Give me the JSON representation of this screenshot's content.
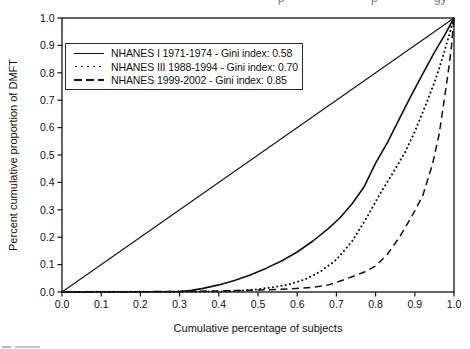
{
  "figure": {
    "background": "#ffffff",
    "ink": "#111111"
  },
  "artifacts": {
    "top_edge_descenders": [
      "p",
      "p",
      "gy"
    ]
  },
  "chart_data": {
    "type": "line",
    "title": "",
    "xlabel": "Cumulative percentage of subjects",
    "ylabel": "Percent cumulative proportion of DMFT",
    "xlim": [
      0.0,
      1.0
    ],
    "ylim": [
      0.0,
      1.0
    ],
    "xtick_labels": [
      "0.0",
      "0.1",
      "0.2",
      "0.3",
      "0.4",
      "0.5",
      "0.6",
      "0.7",
      "0.8",
      "0.9",
      "1.0"
    ],
    "ytick_labels": [
      "0.0",
      "0.1",
      "0.2",
      "0.3",
      "0.4",
      "0.5",
      "0.6",
      "0.7",
      "0.8",
      "0.9",
      "1.0"
    ],
    "grid": false,
    "legend_position": "upper-left",
    "gini_indices": {
      "NHANES I 1971-1974": 0.58,
      "NHANES III 1988-1994": 0.7,
      "NHANES 1999-2002": 0.85
    },
    "series": [
      {
        "name": "Line of equality",
        "style": "solid",
        "reference": true,
        "points": [
          [
            0,
            0
          ],
          [
            1,
            1
          ]
        ]
      },
      {
        "name": "NHANES I 1971-1974 - Gini index: 0.58",
        "style": "solid",
        "reference": false,
        "points": [
          [
            0,
            0
          ],
          [
            0.3,
            0.002
          ],
          [
            0.33,
            0.006
          ],
          [
            0.36,
            0.013
          ],
          [
            0.4,
            0.026
          ],
          [
            0.44,
            0.042
          ],
          [
            0.48,
            0.062
          ],
          [
            0.52,
            0.086
          ],
          [
            0.56,
            0.113
          ],
          [
            0.6,
            0.146
          ],
          [
            0.64,
            0.186
          ],
          [
            0.68,
            0.232
          ],
          [
            0.71,
            0.272
          ],
          [
            0.74,
            0.322
          ],
          [
            0.77,
            0.382
          ],
          [
            0.8,
            0.47
          ],
          [
            0.83,
            0.545
          ],
          [
            0.86,
            0.63
          ],
          [
            0.89,
            0.715
          ],
          [
            0.92,
            0.795
          ],
          [
            0.95,
            0.875
          ],
          [
            0.975,
            0.935
          ],
          [
            1.0,
            1.0
          ]
        ]
      },
      {
        "name": "NHANES III 1988-1994 - Gini index: 0.70",
        "style": "dotted",
        "reference": false,
        "points": [
          [
            0,
            0
          ],
          [
            0.42,
            0.002
          ],
          [
            0.46,
            0.005
          ],
          [
            0.5,
            0.01
          ],
          [
            0.54,
            0.018
          ],
          [
            0.58,
            0.028
          ],
          [
            0.62,
            0.046
          ],
          [
            0.66,
            0.075
          ],
          [
            0.7,
            0.118
          ],
          [
            0.74,
            0.185
          ],
          [
            0.78,
            0.278
          ],
          [
            0.81,
            0.355
          ],
          [
            0.84,
            0.425
          ],
          [
            0.875,
            0.51
          ],
          [
            0.9,
            0.585
          ],
          [
            0.93,
            0.69
          ],
          [
            0.955,
            0.785
          ],
          [
            0.975,
            0.875
          ],
          [
            1.0,
            1.0
          ]
        ]
      },
      {
        "name": "NHANES 1999-2002 - Gini index: 0.85",
        "style": "dashed",
        "reference": false,
        "points": [
          [
            0,
            0
          ],
          [
            0.3,
            0.002
          ],
          [
            0.4,
            0.004
          ],
          [
            0.5,
            0.007
          ],
          [
            0.58,
            0.011
          ],
          [
            0.64,
            0.017
          ],
          [
            0.68,
            0.026
          ],
          [
            0.71,
            0.04
          ],
          [
            0.74,
            0.056
          ],
          [
            0.77,
            0.072
          ],
          [
            0.8,
            0.095
          ],
          [
            0.83,
            0.138
          ],
          [
            0.86,
            0.198
          ],
          [
            0.89,
            0.27
          ],
          [
            0.92,
            0.35
          ],
          [
            0.945,
            0.465
          ],
          [
            0.962,
            0.575
          ],
          [
            0.975,
            0.7
          ],
          [
            0.985,
            0.8
          ],
          [
            0.993,
            0.89
          ],
          [
            1.0,
            1.0
          ]
        ]
      }
    ]
  }
}
